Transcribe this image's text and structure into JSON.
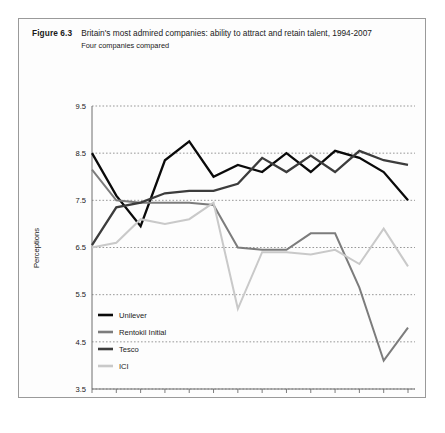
{
  "figure": {
    "label": "Figure 6.3",
    "title": "Britain's most admired companies: ability to attract and retain talent, 1994-2007",
    "subtitle": "Four companies compared"
  },
  "chart_data": {
    "type": "line",
    "title": "Britain's most admired companies: ability to attract and retain talent, 1994-2007",
    "subtitle": "Four companies compared",
    "xlabel": "",
    "ylabel": "Perceptions",
    "ylim": [
      3.5,
      9.5
    ],
    "ytick_values": [
      3.5,
      4.5,
      5.5,
      6.5,
      7.5,
      8.5,
      9.5
    ],
    "ytick_labels": [
      "3.5",
      "4.5",
      "5.5",
      "6.5",
      "7.5",
      "8.5",
      "9.5"
    ],
    "grid": true,
    "grid_style": "dotted-horizontal",
    "legend_position": "bottom-left-inside",
    "categories": [
      "1994",
      "1995",
      "1996",
      "1997",
      "1998",
      "1999",
      "2000",
      "2001",
      "2002",
      "2003",
      "2004",
      "2005",
      "2006",
      "2007"
    ],
    "x": [
      1994,
      1995,
      1996,
      1997,
      1998,
      1999,
      2000,
      2001,
      2002,
      2003,
      2004,
      2005,
      2006,
      2007
    ],
    "series": [
      {
        "name": "Unilever",
        "color": "#0a0a0a",
        "values": [
          8.5,
          7.6,
          6.95,
          8.35,
          8.75,
          8.0,
          8.25,
          8.1,
          8.5,
          8.1,
          8.55,
          8.4,
          8.1,
          7.5
        ]
      },
      {
        "name": "Rentokil Initial",
        "color": "#7c7c7c",
        "values": [
          8.15,
          7.5,
          7.45,
          7.45,
          7.45,
          7.4,
          6.5,
          6.45,
          6.45,
          6.8,
          6.8,
          5.65,
          4.1,
          4.8
        ]
      },
      {
        "name": "Tesco",
        "color": "#3c3c3c",
        "values": [
          6.55,
          7.35,
          7.45,
          7.65,
          7.7,
          7.7,
          7.85,
          8.4,
          8.1,
          8.45,
          8.1,
          8.55,
          8.35,
          8.25
        ]
      },
      {
        "name": "ICI",
        "color": "#c9c9c9",
        "values": [
          6.5,
          6.6,
          7.1,
          7.0,
          7.1,
          7.45,
          5.2,
          6.4,
          6.4,
          6.35,
          6.45,
          6.15,
          6.9,
          6.1
        ]
      }
    ]
  },
  "legend": {
    "items": [
      {
        "label": "Unilever",
        "color": "#0a0a0a"
      },
      {
        "label": "Rentokil Initial",
        "color": "#7c7c7c"
      },
      {
        "label": "Tesco",
        "color": "#3c3c3c"
      },
      {
        "label": "ICI",
        "color": "#c9c9c9"
      }
    ]
  }
}
